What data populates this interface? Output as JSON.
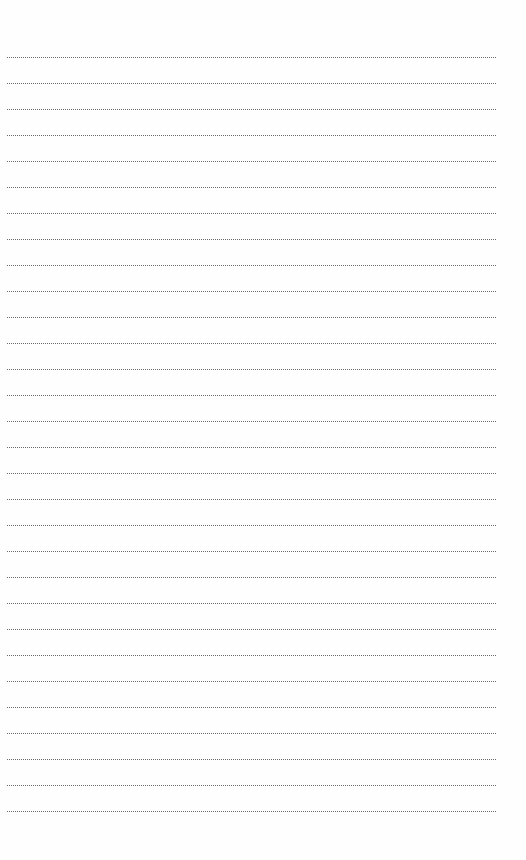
{
  "page": {
    "type": "dotted-lined-notebook-page",
    "line_color": "#6a6a6a",
    "background": "#fefefe",
    "line_count": 30,
    "first_line_y": 57,
    "line_spacing": 26,
    "line_left": 7,
    "line_width": 489
  }
}
